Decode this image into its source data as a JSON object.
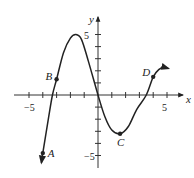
{
  "chart_data": {
    "type": "line",
    "title": "",
    "xlabel": "x",
    "ylabel": "y",
    "xlim": [
      -5.5,
      5.5
    ],
    "ylim": [
      -6,
      6
    ],
    "x_ticks": [
      -5,
      -4,
      -3,
      -2,
      -1,
      1,
      2,
      3,
      4,
      5
    ],
    "y_ticks": [
      -5,
      -4,
      -3,
      -2,
      -1,
      1,
      2,
      3,
      4,
      5
    ],
    "x_tick_labels": [
      {
        "value": -5,
        "label": "−5"
      },
      {
        "value": 5,
        "label": "5"
      }
    ],
    "y_tick_labels": [
      {
        "value": 5,
        "label": "5"
      },
      {
        "value": -5,
        "label": "−5"
      }
    ],
    "grid": false,
    "series": [
      {
        "name": "f(x)",
        "points": [
          [
            -4.1,
            -5.6
          ],
          [
            -4.0,
            -4.8
          ],
          [
            -3.6,
            -2.0
          ],
          [
            -3.3,
            0.0
          ],
          [
            -3.0,
            1.3
          ],
          [
            -2.5,
            3.5
          ],
          [
            -2.0,
            4.7
          ],
          [
            -1.6,
            5.0
          ],
          [
            -1.2,
            4.6
          ],
          [
            -0.7,
            2.8
          ],
          [
            0.0,
            0.0
          ],
          [
            0.5,
            -1.8
          ],
          [
            1.0,
            -2.9
          ],
          [
            1.6,
            -3.2
          ],
          [
            2.2,
            -2.6
          ],
          [
            2.8,
            -1.2
          ],
          [
            3.5,
            0.0
          ],
          [
            4.0,
            1.5
          ],
          [
            4.4,
            2.1
          ],
          [
            4.8,
            2.3
          ],
          [
            5.1,
            2.2
          ]
        ],
        "arrow_start": true,
        "arrow_end": true
      }
    ],
    "labeled_points": [
      {
        "label": "A",
        "x": -4.0,
        "y": -4.8
      },
      {
        "label": "B",
        "x": -3.0,
        "y": 1.3
      },
      {
        "label": "C",
        "x": 1.6,
        "y": -3.2
      },
      {
        "label": "D",
        "x": 4.0,
        "y": 1.5
      }
    ]
  }
}
